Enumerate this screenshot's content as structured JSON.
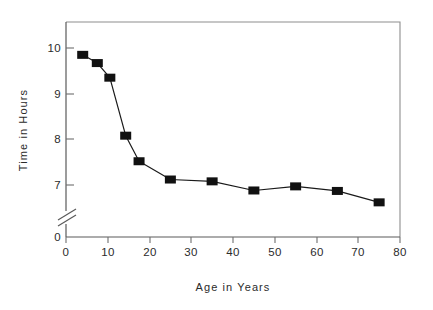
{
  "chart_data": {
    "type": "line",
    "title": "",
    "subtitle": "",
    "xlabel": "Age in Years",
    "ylabel": "Time in Hours",
    "xlim": [
      0,
      80
    ],
    "ylim": [
      6.5,
      10.5
    ],
    "grid": false,
    "legend": null,
    "legend_position": "none",
    "marker": "filled-square",
    "line_color": "#111111",
    "marker_color": "#111111",
    "y_axis_break": true,
    "y_axis_break_note": "axis broken between 0 and just under 7",
    "xticks": [
      0,
      10,
      20,
      30,
      40,
      50,
      60,
      70,
      80
    ],
    "xtick_labels": [
      "0",
      "10",
      "20",
      "30",
      "40",
      "50",
      "60",
      "70",
      "80"
    ],
    "yticks": [
      0,
      7,
      8,
      9,
      10
    ],
    "ytick_labels": [
      "0",
      "7",
      "8",
      "9",
      "10"
    ],
    "x": [
      4,
      7.5,
      10.5,
      14.3,
      17.5,
      25,
      35,
      45,
      55,
      65,
      75
    ],
    "values": [
      9.85,
      9.67,
      9.35,
      8.08,
      7.52,
      7.12,
      7.08,
      6.88,
      6.97,
      6.87,
      6.62
    ],
    "points": [
      {
        "age": 4,
        "hours": 9.85
      },
      {
        "age": 7.5,
        "hours": 9.67
      },
      {
        "age": 10.5,
        "hours": 9.35
      },
      {
        "age": 14.3,
        "hours": 8.08
      },
      {
        "age": 17.5,
        "hours": 7.52
      },
      {
        "age": 25,
        "hours": 7.12
      },
      {
        "age": 35,
        "hours": 7.08
      },
      {
        "age": 45,
        "hours": 6.88
      },
      {
        "age": 55,
        "hours": 6.97
      },
      {
        "age": 65,
        "hours": 6.87
      },
      {
        "age": 75,
        "hours": 6.62
      }
    ]
  },
  "axes": {
    "x_title": "Age in Years",
    "y_title": "Time in Hours",
    "x_tick_labels": [
      "0",
      "10",
      "20",
      "30",
      "40",
      "50",
      "60",
      "70",
      "80"
    ],
    "y_tick_labels": [
      "10",
      "9",
      "8",
      "7",
      "0"
    ]
  },
  "colors": {
    "background": "#ffffff",
    "line": "#111111",
    "marker": "#111111",
    "frame": "#8e8e8e",
    "axis": "#5a5a5a",
    "text": "#2b2b2b"
  }
}
